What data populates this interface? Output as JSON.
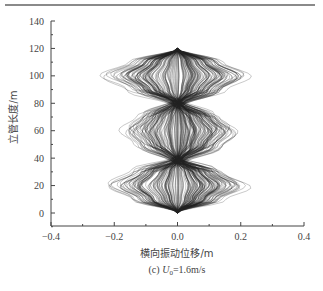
{
  "chart_data": {
    "type": "line",
    "title": "",
    "caption": "(c) U0=1.6m/s",
    "caption_parts": {
      "prefix": "(c) ",
      "var": "U",
      "sub": "0",
      "suffix": "=1.6m/s"
    },
    "xlabel": "横向振动位移/m",
    "ylabel": "立管长度/m",
    "xlim": [
      -0.4,
      0.4
    ],
    "ylim": [
      -10,
      140
    ],
    "xticks": [
      -0.4,
      -0.2,
      0.0,
      0.2,
      0.4
    ],
    "xtick_labels": [
      "−0.4",
      "−0.2",
      "0.0",
      "0.2",
      "0.4"
    ],
    "yticks": [
      0,
      20,
      40,
      60,
      80,
      100,
      120,
      140
    ],
    "ytick_labels": [
      "0",
      "20",
      "40",
      "60",
      "80",
      "100",
      "120",
      "140"
    ],
    "grid": false,
    "legend": null,
    "envelope": {
      "depth_m": [
        0,
        10,
        20,
        30,
        38,
        50,
        60,
        70,
        80,
        90,
        100,
        110,
        120
      ],
      "max_displacement_m": [
        0.0,
        0.15,
        0.23,
        0.15,
        0.02,
        0.15,
        0.2,
        0.14,
        0.02,
        0.16,
        0.24,
        0.15,
        0.0
      ]
    },
    "series_count_approx": 200,
    "line_color": "#222222"
  }
}
